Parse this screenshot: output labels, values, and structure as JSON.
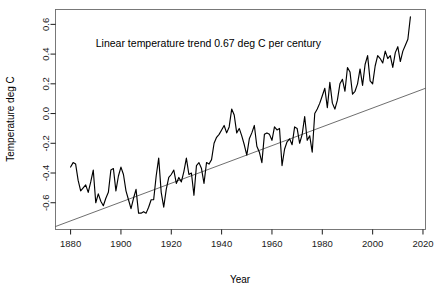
{
  "chart_data": {
    "type": "line",
    "title": "",
    "xlabel": "Year",
    "ylabel": "Temperature deg C",
    "xlim": [
      1874,
      2021
    ],
    "ylim": [
      -0.78,
      0.7
    ],
    "grid": false,
    "legend": null,
    "annotations": [
      {
        "text": "Linear temperature trend 0.67 deg C per century",
        "x": 1890,
        "y": 0.45
      }
    ],
    "xticks": [
      1880,
      1900,
      1920,
      1940,
      1960,
      1980,
      2000,
      2020
    ],
    "xtick_labels": [
      "1880",
      "1900",
      "1920",
      "1940",
      "1960",
      "1980",
      "2000",
      "2020"
    ],
    "yticks": [
      -0.6,
      -0.4,
      -0.2,
      0.0,
      0.2,
      0.4,
      0.6
    ],
    "ytick_labels": [
      "-0.6",
      "-0.4",
      "-0.2",
      "0.0",
      "0.2",
      "0.4",
      "0.6"
    ],
    "series": [
      {
        "name": "Global mean temperature anomaly",
        "type": "line",
        "color": "#000000",
        "x": [
          1880,
          1881,
          1882,
          1883,
          1884,
          1885,
          1886,
          1887,
          1888,
          1889,
          1890,
          1891,
          1892,
          1893,
          1894,
          1895,
          1896,
          1897,
          1898,
          1899,
          1900,
          1901,
          1902,
          1903,
          1904,
          1905,
          1906,
          1907,
          1908,
          1909,
          1910,
          1911,
          1912,
          1913,
          1914,
          1915,
          1916,
          1917,
          1918,
          1919,
          1920,
          1921,
          1922,
          1923,
          1924,
          1925,
          1926,
          1927,
          1928,
          1929,
          1930,
          1931,
          1932,
          1933,
          1934,
          1935,
          1936,
          1937,
          1938,
          1939,
          1940,
          1941,
          1942,
          1943,
          1944,
          1945,
          1946,
          1947,
          1948,
          1949,
          1950,
          1951,
          1952,
          1953,
          1954,
          1955,
          1956,
          1957,
          1958,
          1959,
          1960,
          1961,
          1962,
          1963,
          1964,
          1965,
          1966,
          1967,
          1968,
          1969,
          1970,
          1971,
          1972,
          1973,
          1974,
          1975,
          1976,
          1977,
          1978,
          1979,
          1980,
          1981,
          1982,
          1983,
          1984,
          1985,
          1986,
          1987,
          1988,
          1989,
          1990,
          1991,
          1992,
          1993,
          1994,
          1995,
          1996,
          1997,
          1998,
          1999,
          2000,
          2001,
          2002,
          2003,
          2004,
          2005,
          2006,
          2007,
          2008,
          2009,
          2010,
          2011,
          2012,
          2013,
          2014,
          2015
        ],
        "values": [
          -0.36,
          -0.33,
          -0.34,
          -0.45,
          -0.52,
          -0.5,
          -0.48,
          -0.53,
          -0.46,
          -0.38,
          -0.6,
          -0.54,
          -0.59,
          -0.62,
          -0.57,
          -0.53,
          -0.38,
          -0.37,
          -0.52,
          -0.42,
          -0.36,
          -0.41,
          -0.52,
          -0.58,
          -0.64,
          -0.57,
          -0.51,
          -0.67,
          -0.67,
          -0.66,
          -0.67,
          -0.63,
          -0.58,
          -0.58,
          -0.42,
          -0.3,
          -0.53,
          -0.63,
          -0.51,
          -0.43,
          -0.41,
          -0.38,
          -0.47,
          -0.43,
          -0.46,
          -0.39,
          -0.3,
          -0.41,
          -0.4,
          -0.55,
          -0.35,
          -0.33,
          -0.37,
          -0.47,
          -0.33,
          -0.34,
          -0.31,
          -0.2,
          -0.16,
          -0.14,
          -0.11,
          -0.08,
          -0.13,
          -0.09,
          0.03,
          -0.01,
          -0.13,
          -0.1,
          -0.15,
          -0.21,
          -0.28,
          -0.17,
          -0.13,
          -0.08,
          -0.22,
          -0.26,
          -0.33,
          -0.14,
          -0.13,
          -0.14,
          -0.18,
          -0.09,
          -0.11,
          -0.1,
          -0.35,
          -0.24,
          -0.19,
          -0.17,
          -0.21,
          -0.09,
          -0.1,
          -0.2,
          -0.14,
          -0.02,
          -0.18,
          -0.15,
          -0.26,
          0.0,
          0.03,
          0.07,
          0.12,
          0.17,
          0.04,
          0.21,
          0.07,
          0.03,
          0.09,
          0.2,
          0.23,
          0.15,
          0.31,
          0.28,
          0.13,
          0.15,
          0.2,
          0.3,
          0.19,
          0.33,
          0.39,
          0.22,
          0.2,
          0.32,
          0.39,
          0.37,
          0.34,
          0.42,
          0.37,
          0.39,
          0.31,
          0.41,
          0.45,
          0.35,
          0.42,
          0.46,
          0.5,
          0.65
        ]
      },
      {
        "name": "Linear trend",
        "type": "line",
        "color": "#3d3d3d",
        "x": [
          1874,
          2021
        ],
        "values": [
          -0.76,
          0.17
        ],
        "slope_per_century": 0.67
      }
    ]
  }
}
